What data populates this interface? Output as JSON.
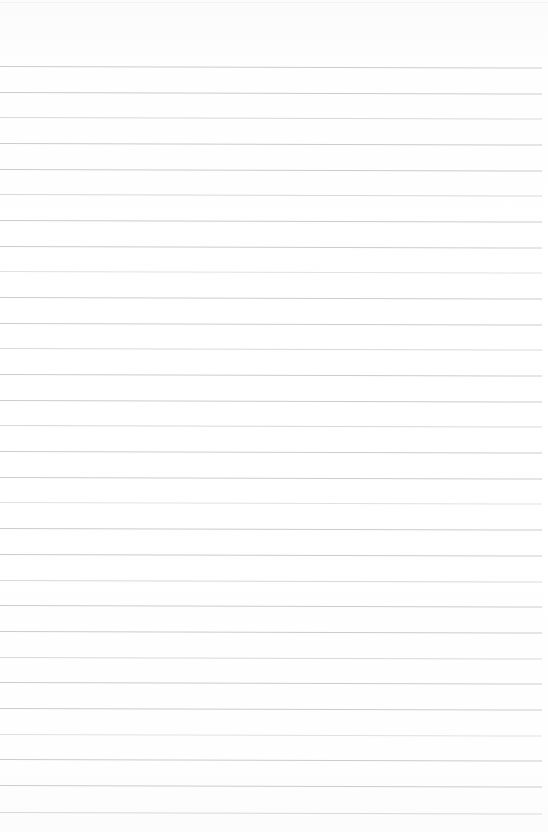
{
  "document": {
    "type": "lined-notebook-page",
    "title": "Blank ruled notebook page",
    "content_text": "",
    "handwriting_present": "no",
    "page_width_px": 548,
    "page_height_px": 832,
    "background_color": "#fdfdfd",
    "rule_color": "#c9ccd1",
    "rule_thickness_px": 1,
    "rule_spacing_px": 25.7,
    "first_rule_y_px": 66,
    "last_rule_y_px": 812,
    "rule_count": 30,
    "left_margin_px": 0,
    "right_margin_px": 6,
    "top_margin_px": 66,
    "skew_degrees": 0.16,
    "lines": [
      {
        "index": 1,
        "y": 66,
        "tone": "normal",
        "text": ""
      },
      {
        "index": 2,
        "y": 92,
        "tone": "normal",
        "text": ""
      },
      {
        "index": 3,
        "y": 117,
        "tone": "soft",
        "text": ""
      },
      {
        "index": 4,
        "y": 143,
        "tone": "normal",
        "text": ""
      },
      {
        "index": 5,
        "y": 169,
        "tone": "normal",
        "text": ""
      },
      {
        "index": 6,
        "y": 194,
        "tone": "soft",
        "text": ""
      },
      {
        "index": 7,
        "y": 220,
        "tone": "normal",
        "text": ""
      },
      {
        "index": 8,
        "y": 246,
        "tone": "normal",
        "text": ""
      },
      {
        "index": 9,
        "y": 271,
        "tone": "faint",
        "text": ""
      },
      {
        "index": 10,
        "y": 297,
        "tone": "normal",
        "text": ""
      },
      {
        "index": 11,
        "y": 323,
        "tone": "normal",
        "text": ""
      },
      {
        "index": 12,
        "y": 348,
        "tone": "soft",
        "text": ""
      },
      {
        "index": 13,
        "y": 374,
        "tone": "normal",
        "text": ""
      },
      {
        "index": 14,
        "y": 400,
        "tone": "normal",
        "text": ""
      },
      {
        "index": 15,
        "y": 425,
        "tone": "soft",
        "text": ""
      },
      {
        "index": 16,
        "y": 451,
        "tone": "normal",
        "text": ""
      },
      {
        "index": 17,
        "y": 477,
        "tone": "normal",
        "text": ""
      },
      {
        "index": 18,
        "y": 502,
        "tone": "faint",
        "text": ""
      },
      {
        "index": 19,
        "y": 528,
        "tone": "normal",
        "text": ""
      },
      {
        "index": 20,
        "y": 554,
        "tone": "normal",
        "text": ""
      },
      {
        "index": 21,
        "y": 580,
        "tone": "soft",
        "text": ""
      },
      {
        "index": 22,
        "y": 605,
        "tone": "normal",
        "text": ""
      },
      {
        "index": 23,
        "y": 631,
        "tone": "normal",
        "text": ""
      },
      {
        "index": 24,
        "y": 657,
        "tone": "soft",
        "text": ""
      },
      {
        "index": 25,
        "y": 682,
        "tone": "normal",
        "text": ""
      },
      {
        "index": 26,
        "y": 708,
        "tone": "normal",
        "text": ""
      },
      {
        "index": 27,
        "y": 734,
        "tone": "faint",
        "text": ""
      },
      {
        "index": 28,
        "y": 759,
        "tone": "normal",
        "text": ""
      },
      {
        "index": 29,
        "y": 785,
        "tone": "normal",
        "text": ""
      },
      {
        "index": 30,
        "y": 812,
        "tone": "soft",
        "text": ""
      }
    ]
  }
}
